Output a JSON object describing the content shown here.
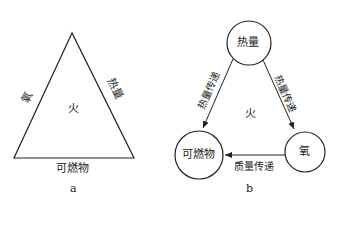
{
  "diagram_a": {
    "caption": "a",
    "left_side_label": "氧",
    "right_side_label": "热量",
    "bottom_label": "可燃物",
    "center_label": "火"
  },
  "diagram_b": {
    "caption": "b",
    "nodes": {
      "top": "热量",
      "bottom_left": "可燃物",
      "bottom_right": "氧"
    },
    "edges": {
      "left": "热量传递",
      "right": "热量传递",
      "bottom": "质量传递"
    },
    "center_label": "火"
  }
}
